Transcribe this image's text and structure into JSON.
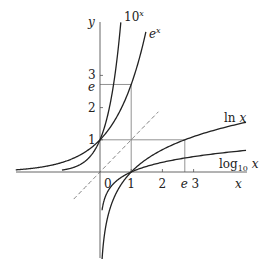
{
  "chart_data": {
    "type": "line",
    "title": "",
    "xlabel": "x",
    "ylabel": "y",
    "xlim": [
      -2.7,
      4.7
    ],
    "ylim": [
      -2.7,
      4.7
    ],
    "grid": false,
    "x_ticks": [
      {
        "value": 0,
        "label": "0"
      },
      {
        "value": 1,
        "label": "1"
      },
      {
        "value": 2,
        "label": "2"
      },
      {
        "value": 2.718,
        "label": "e"
      },
      {
        "value": 3,
        "label": "3"
      }
    ],
    "y_ticks": [
      {
        "value": 1,
        "label": "1"
      },
      {
        "value": 2,
        "label": "2"
      },
      {
        "value": 2.718,
        "label": "e"
      },
      {
        "value": 3,
        "label": "3"
      }
    ],
    "series": [
      {
        "name": "10^x",
        "label_base": "10",
        "label_sup": "x",
        "function": "pow10",
        "x_range": [
          -1.22,
          0.667
        ],
        "style": "solid"
      },
      {
        "name": "e^x",
        "label_base": "e",
        "label_sup": "x",
        "function": "exp",
        "x_range": [
          -2.7,
          1.47
        ],
        "style": "solid"
      },
      {
        "name": "ln x",
        "label_text": "ln x",
        "function": "ln",
        "x_range": [
          0.067,
          4.68
        ],
        "style": "solid"
      },
      {
        "name": "log10 x",
        "label_base": "log",
        "label_sub": "10",
        "label_var": "x",
        "function": "log10",
        "x_range": [
          0.065,
          4.68
        ],
        "style": "solid"
      },
      {
        "name": "y = x",
        "function": "identity",
        "x_range": [
          -0.84,
          1.87
        ],
        "style": "dashed"
      }
    ],
    "guides": [
      {
        "name": "horizontal-y-equals-e",
        "from": [
          0,
          2.718
        ],
        "to": [
          1,
          2.718
        ]
      },
      {
        "name": "vertical-x-equals-1",
        "from": [
          1,
          0
        ],
        "to": [
          1,
          2.718
        ]
      },
      {
        "name": "horizontal-y-equals-1",
        "from": [
          0,
          1
        ],
        "to": [
          2.718,
          1
        ]
      },
      {
        "name": "vertical-x-equals-e",
        "from": [
          2.718,
          0
        ],
        "to": [
          2.718,
          1
        ]
      }
    ],
    "annotations": [
      {
        "text": "0",
        "at": "origin"
      }
    ]
  }
}
